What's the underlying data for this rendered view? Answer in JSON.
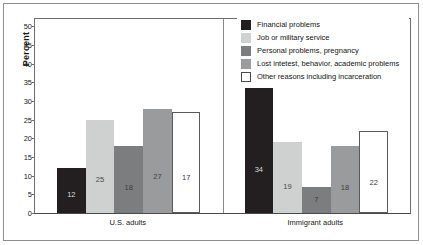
{
  "chart_data": {
    "type": "bar",
    "title": "",
    "xlabel": "",
    "ylabel": "Percent",
    "ylim": [
      0,
      52
    ],
    "ytick_labels": [
      "0",
      "5",
      "10",
      "15",
      "20",
      "25",
      "30",
      "35",
      "40",
      "45",
      "50"
    ],
    "ytick_values": [
      0,
      5,
      10,
      15,
      20,
      25,
      30,
      35,
      40,
      45,
      50
    ],
    "grid": false,
    "legend_position": "top-right",
    "categories": [
      "U.S. adults",
      "Immigrant adults"
    ],
    "series": [
      {
        "name": "Financial problems",
        "color": "#231f20",
        "values": [
          12,
          34
        ],
        "labels": [
          "12",
          "34"
        ]
      },
      {
        "name": "Job or military service",
        "color": "#cfd0d0",
        "values": [
          25,
          19
        ],
        "labels": [
          "25",
          "19"
        ]
      },
      {
        "name": "Personal problems, pregnancy",
        "color": "#7c7d7f",
        "values": [
          18,
          7
        ],
        "labels": [
          "18",
          "7"
        ]
      },
      {
        "name": "Lost intetest, behavior, academic problems",
        "color": "#9a9b9d",
        "values": [
          28,
          18
        ],
        "labels": [
          "27",
          "18"
        ]
      },
      {
        "name": "Other reasons including incarceration",
        "color": "#ffffff",
        "values": [
          27,
          22
        ],
        "labels": [
          "17",
          "22"
        ]
      }
    ]
  },
  "axis": {
    "ylabel": "Percent",
    "ticks": [
      "50",
      "45",
      "40",
      "35",
      "30",
      "25",
      "20",
      "15",
      "10",
      "5",
      "0"
    ]
  },
  "groups": [
    {
      "label": "U.S. adults"
    },
    {
      "label": "Immigrant adults"
    }
  ],
  "legend": {
    "items": [
      {
        "label": "Financial problems",
        "color": "#231f20"
      },
      {
        "label": "Job or military service",
        "color": "#cfd0d0"
      },
      {
        "label": "Personal problems, pregnancy",
        "color": "#7c7d7f"
      },
      {
        "label": "Lost intetest, behavior, academic problems",
        "color": "#9a9b9d"
      },
      {
        "label": "Other reasons including incarceration",
        "color": "#ffffff"
      }
    ]
  }
}
